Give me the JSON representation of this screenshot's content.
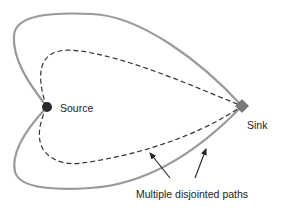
{
  "diagram": {
    "type": "flow-paths",
    "nodes": [
      {
        "id": "source",
        "label": "Source",
        "shape": "circle",
        "color": "#2a2a2a"
      },
      {
        "id": "sink",
        "label": "Sink",
        "shape": "diamond",
        "color": "#7a7a7a"
      }
    ],
    "paths": [
      {
        "id": "outer-top",
        "style": "solid",
        "color": "#9a9a9a",
        "from": "source",
        "to": "sink"
      },
      {
        "id": "outer-bottom",
        "style": "solid",
        "color": "#9a9a9a",
        "from": "source",
        "to": "sink"
      },
      {
        "id": "inner-top",
        "style": "dashed",
        "color": "#333333",
        "from": "source",
        "to": "sink"
      },
      {
        "id": "inner-bottom",
        "style": "dashed",
        "color": "#333333",
        "from": "source",
        "to": "sink"
      }
    ],
    "annotation": {
      "text": "Multiple disjointed paths",
      "arrow_count": 2
    }
  }
}
